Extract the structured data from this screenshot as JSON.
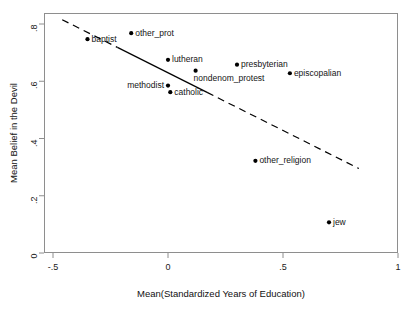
{
  "chart_data": {
    "type": "scatter",
    "title": "",
    "xlabel": "Mean(Standardized Years of Education)",
    "ylabel": "Mean Belief in the Devil",
    "xlim": [
      -0.5,
      1.0
    ],
    "ylim": [
      0.0,
      0.8
    ],
    "xticks": [
      "-.5",
      "0",
      ".5",
      "1"
    ],
    "xtick_values": [
      -0.5,
      0,
      0.5,
      1
    ],
    "yticks": [
      "0",
      ".2",
      ".4",
      ".6",
      ".8"
    ],
    "ytick_values": [
      0,
      0.2,
      0.4,
      0.6,
      0.8
    ],
    "grid": false,
    "legend": "none",
    "marker": "filled-circle",
    "marker_color": "#000000",
    "points": [
      {
        "label": "baptist",
        "x": -0.35,
        "y": 0.747,
        "label_side": "right"
      },
      {
        "label": "other_prot",
        "x": -0.16,
        "y": 0.768,
        "label_side": "right"
      },
      {
        "label": "lutheran",
        "x": 0.0,
        "y": 0.675,
        "label_side": "right"
      },
      {
        "label": "nondenom_protest",
        "x": 0.12,
        "y": 0.637,
        "label_side": "below"
      },
      {
        "label": "presbyterian",
        "x": 0.3,
        "y": 0.658,
        "label_side": "right"
      },
      {
        "label": "episcopalian",
        "x": 0.53,
        "y": 0.628,
        "label_side": "right"
      },
      {
        "label": "methodist",
        "x": 0.0,
        "y": 0.585,
        "label_side": "left"
      },
      {
        "label": "catholic",
        "x": 0.01,
        "y": 0.562,
        "label_side": "right"
      },
      {
        "label": "other_religion",
        "x": 0.38,
        "y": 0.322,
        "label_side": "right"
      },
      {
        "label": "jew",
        "x": 0.7,
        "y": 0.107,
        "label_side": "right"
      }
    ],
    "fitline": {
      "x_start": -0.46,
      "y_start": 0.815,
      "x_end": 0.83,
      "y_end": 0.295,
      "solid_segment": {
        "x_start": -0.22,
        "x_end": 0.17
      },
      "style": "dashed-with-solid-middle",
      "color": "#000000"
    }
  }
}
